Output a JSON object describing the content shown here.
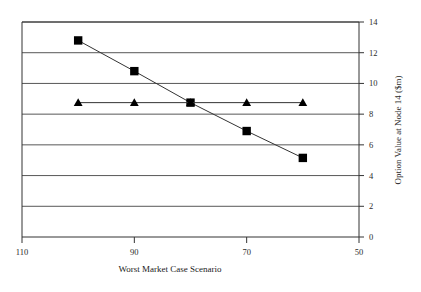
{
  "chart_data": {
    "type": "line",
    "title": "",
    "xlabel": "Worst Market Case Scenario",
    "ylabel": "Option Value at Node 14 ($m)",
    "xlim": [
      110,
      50
    ],
    "ylim": [
      0,
      14
    ],
    "x_reversed": true,
    "xticks": [
      110,
      90,
      70,
      50
    ],
    "xtick_labels": [
      "110",
      "90",
      "70",
      "50"
    ],
    "yticks": [
      0,
      2,
      4,
      6,
      8,
      10,
      12,
      14
    ],
    "ytick_labels": [
      "0",
      "2",
      "4",
      "6",
      "8",
      "10",
      "12",
      "14"
    ],
    "y_axis_position": "right",
    "grid": true,
    "grid_axis": "y",
    "legend": "none",
    "series": [
      {
        "name": "square-series",
        "marker": "square",
        "color": "#000000",
        "x": [
          100,
          90,
          80,
          70,
          60
        ],
        "values": [
          12.8,
          10.8,
          8.75,
          6.9,
          5.15
        ]
      },
      {
        "name": "triangle-series",
        "marker": "triangle",
        "color": "#000000",
        "x": [
          100,
          90,
          80,
          70,
          60
        ],
        "values": [
          8.75,
          8.75,
          8.75,
          8.75,
          8.75
        ]
      }
    ]
  },
  "axes": {
    "x_title": "Worst Market Case Scenario",
    "y_title": "Option Value at Node 14 ($m)",
    "x_labels": [
      "110",
      "90",
      "70",
      "50"
    ],
    "y_labels": [
      "0",
      "2",
      "4",
      "6",
      "8",
      "10",
      "12",
      "14"
    ]
  },
  "colors": {
    "plot_border": "#333333",
    "gridline": "#444444",
    "marker": "#000000",
    "series_line": "#333333",
    "background": "#ffffff"
  }
}
